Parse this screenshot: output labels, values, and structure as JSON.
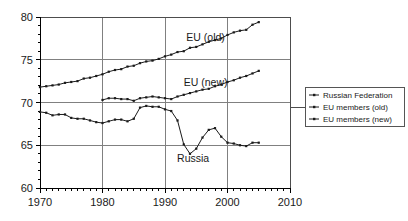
{
  "chart_data": {
    "type": "line",
    "title": "",
    "subtitle": "",
    "xlabel": "",
    "ylabel": "",
    "xlim": [
      1970,
      2010
    ],
    "ylim": [
      60,
      80
    ],
    "xticks": [
      "1970",
      "1980",
      "1990",
      "2000",
      "2010"
    ],
    "yticks": [
      "60",
      "65",
      "70",
      "75",
      "80"
    ],
    "xtick_values": [
      1970,
      1980,
      1990,
      2000,
      2010
    ],
    "ytick_values": [
      60,
      65,
      70,
      75,
      80
    ],
    "x_minor_tick_interval": 1,
    "grid": "both",
    "legend_position": "right-outside",
    "markers": "filled-square",
    "annotations": [
      {
        "text": "EU (old)",
        "x": 1996.5,
        "y": 77.2
      },
      {
        "text": "EU (new)",
        "x": 1996.5,
        "y": 71.9
      },
      {
        "text": "Russia",
        "x": 1994.5,
        "y": 63.0
      }
    ],
    "series": [
      {
        "name": "Russian Federation",
        "legend_label": "Russian Federation",
        "x": [
          1970,
          1971,
          1972,
          1973,
          1974,
          1975,
          1976,
          1977,
          1978,
          1979,
          1980,
          1981,
          1982,
          1983,
          1984,
          1985,
          1986,
          1987,
          1988,
          1989,
          1990,
          1991,
          1992,
          1993,
          1994,
          1995,
          1996,
          1997,
          1998,
          1999,
          2000,
          2001,
          2002,
          2003,
          2004,
          2005
        ],
        "values": [
          68.9,
          68.8,
          68.5,
          68.6,
          68.6,
          68.2,
          68.1,
          68.1,
          67.9,
          67.7,
          67.6,
          67.8,
          68.0,
          68.0,
          67.8,
          68.1,
          69.4,
          69.6,
          69.5,
          69.5,
          69.2,
          69.0,
          67.9,
          65.1,
          64.0,
          64.6,
          65.9,
          66.8,
          67.0,
          66.0,
          65.3,
          65.2,
          65.0,
          64.9,
          65.3,
          65.3
        ]
      },
      {
        "name": "EU members (old)",
        "legend_label": "EU members (old)",
        "x": [
          1970,
          1971,
          1972,
          1973,
          1974,
          1975,
          1976,
          1977,
          1978,
          1979,
          1980,
          1981,
          1982,
          1983,
          1984,
          1985,
          1986,
          1987,
          1988,
          1989,
          1990,
          1991,
          1992,
          1993,
          1994,
          1995,
          1996,
          1997,
          1998,
          1999,
          2000,
          2001,
          2002,
          2003,
          2004,
          2005
        ],
        "values": [
          71.8,
          71.9,
          72.0,
          72.1,
          72.3,
          72.4,
          72.5,
          72.8,
          72.9,
          73.1,
          73.3,
          73.6,
          73.8,
          73.9,
          74.2,
          74.3,
          74.6,
          74.8,
          74.9,
          75.1,
          75.4,
          75.6,
          75.9,
          76.0,
          76.4,
          76.5,
          76.8,
          77.1,
          77.3,
          77.5,
          77.9,
          78.2,
          78.4,
          78.5,
          79.1,
          79.4
        ]
      },
      {
        "name": "EU members (new)",
        "legend_label": "EU members (new)",
        "x": [
          1980,
          1981,
          1982,
          1983,
          1984,
          1985,
          1986,
          1987,
          1988,
          1989,
          1990,
          1991,
          1992,
          1993,
          1994,
          1995,
          1996,
          1997,
          1998,
          1999,
          2000,
          2001,
          2002,
          2003,
          2004,
          2005
        ],
        "values": [
          70.3,
          70.5,
          70.5,
          70.4,
          70.4,
          70.2,
          70.5,
          70.6,
          70.7,
          70.6,
          70.5,
          70.4,
          70.7,
          70.9,
          71.1,
          71.3,
          71.5,
          71.6,
          71.9,
          72.1,
          72.4,
          72.6,
          72.9,
          73.1,
          73.4,
          73.7
        ]
      }
    ]
  },
  "legend": {
    "entries": [
      {
        "label": "Russian Federation"
      },
      {
        "label": "EU members (old)"
      },
      {
        "label": "EU members (new)"
      }
    ]
  }
}
